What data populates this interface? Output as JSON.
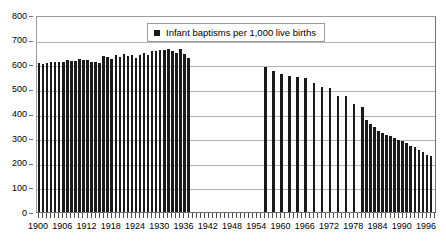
{
  "chart_data": {
    "type": "bar",
    "title": "",
    "subtitle": "",
    "xlabel": "",
    "ylabel": "",
    "ylim": [
      0,
      800
    ],
    "ytick_step": 100,
    "ytick_labels": [
      "800",
      "700",
      "600",
      "500",
      "400",
      "300",
      "200",
      "100",
      "0"
    ],
    "ytick_values": [
      800,
      700,
      600,
      500,
      400,
      300,
      200,
      100,
      0
    ],
    "grid": true,
    "legend_position": "top-center-inside",
    "legend": [
      "Infant baptisms per 1,000 live births"
    ],
    "xlim": [
      1900,
      1998
    ],
    "xtick_labels": [
      "1900",
      "1906",
      "1912",
      "1918",
      "1924",
      "1930",
      "1936",
      "1942",
      "1948",
      "1954",
      "1960",
      "1966",
      "1972",
      "1978",
      "1984",
      "1990",
      "1996"
    ],
    "xtick_values": [
      1900,
      1906,
      1912,
      1918,
      1924,
      1930,
      1936,
      1942,
      1948,
      1954,
      1960,
      1966,
      1972,
      1978,
      1984,
      1990,
      1996
    ],
    "series": [
      {
        "name": "Infant baptisms per 1,000 live births",
        "color": "#1a1a1a",
        "x": [
          1900,
          1901,
          1902,
          1903,
          1904,
          1905,
          1906,
          1907,
          1908,
          1909,
          1910,
          1911,
          1912,
          1913,
          1914,
          1915,
          1916,
          1917,
          1918,
          1919,
          1920,
          1921,
          1922,
          1923,
          1924,
          1925,
          1926,
          1927,
          1928,
          1929,
          1930,
          1931,
          1932,
          1933,
          1934,
          1935,
          1936,
          1937,
          1956,
          1958,
          1960,
          1962,
          1964,
          1966,
          1968,
          1970,
          1972,
          1974,
          1976,
          1978,
          1980,
          1981,
          1982,
          1983,
          1984,
          1985,
          1986,
          1987,
          1988,
          1989,
          1990,
          1991,
          1992,
          1993,
          1994,
          1995,
          1996,
          1997
        ],
        "values": [
          605,
          600,
          604,
          608,
          609,
          610,
          611,
          617,
          615,
          612,
          620,
          618,
          616,
          608,
          611,
          605,
          634,
          631,
          623,
          636,
          629,
          640,
          633,
          637,
          625,
          639,
          645,
          637,
          654,
          652,
          658,
          657,
          660,
          652,
          645,
          660,
          642,
          627,
          589,
          572,
          560,
          551,
          548,
          545,
          525,
          509,
          503,
          470,
          470,
          437,
          425,
          375,
          357,
          344,
          331,
          321,
          314,
          307,
          300,
          292,
          288,
          279,
          270,
          262,
          252,
          242,
          232,
          228
        ]
      }
    ]
  },
  "legend": {
    "entry_label": "Infant baptisms per 1,000 live births",
    "swatch_name": "legend-swatch-series-1"
  }
}
